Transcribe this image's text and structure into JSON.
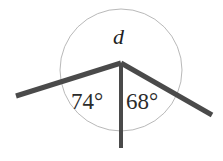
{
  "figure": {
    "background_color": "#ffffff",
    "width": 223,
    "height": 161,
    "circle": {
      "center_x": 121,
      "center_y": 70,
      "radius": 61,
      "stroke_color": "#b9b9b9",
      "stroke_width": 1,
      "fill": "none"
    },
    "vertex": {
      "x": 121,
      "y": 63
    },
    "rays": [
      {
        "name": "left-arm",
        "from_x": 121,
        "from_y": 63,
        "to_x": 16,
        "to_y": 96,
        "stroke_color": "#4a4a4a",
        "stroke_width": 5
      },
      {
        "name": "right-arm",
        "from_x": 121,
        "from_y": 63,
        "to_x": 212,
        "to_y": 115,
        "stroke_color": "#4a4a4a",
        "stroke_width": 5
      },
      {
        "name": "vertical-ray",
        "from_x": 121,
        "from_y": 63,
        "to_x": 121,
        "to_y": 148,
        "stroke_color": "#4a4a4a",
        "stroke_width": 4
      }
    ],
    "labels": {
      "reflex_angle": "d",
      "left_angle": "74°",
      "right_angle": "68°"
    }
  }
}
